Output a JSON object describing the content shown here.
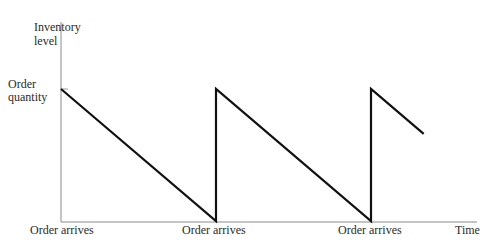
{
  "chart_data": {
    "type": "line",
    "title": "",
    "xlabel": "Time",
    "ylabel": "Inventory level",
    "y_tick_label": "Order quantity",
    "x_tick_labels": [
      "Order arrives",
      "Order arrives",
      "Order arrives"
    ],
    "grid": false,
    "legend": null,
    "series": [
      {
        "name": "Inventory level",
        "color": "#111111",
        "points": [
          {
            "x": 0.0,
            "y": 1.0
          },
          {
            "x": 1.0,
            "y": 0.0
          },
          {
            "x": 1.0,
            "y": 1.0
          },
          {
            "x": 2.0,
            "y": 0.0
          },
          {
            "x": 2.0,
            "y": 1.0
          },
          {
            "x": 2.34,
            "y": 0.66
          }
        ]
      }
    ],
    "xlim": [
      0,
      2.6
    ],
    "ylim": [
      0,
      1.5
    ]
  },
  "labels": {
    "ylabel_line1": "Inventory",
    "ylabel_line2": "level",
    "ytick_line1": "Order",
    "ytick_line2": "quantity",
    "xtick_0": "Order arrives",
    "xtick_1": "Order arrives",
    "xtick_2": "Order arrives",
    "xlabel": "Time"
  }
}
